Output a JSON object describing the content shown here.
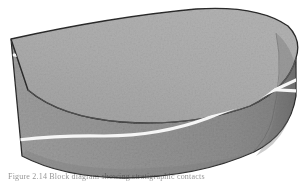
{
  "figure": {
    "shape_name": "half-cylinder block",
    "caption": "Figure 2.14 Block diagram showing stratigraphic contacts",
    "background_color": "#ffffff",
    "outline_color": "#2b2b2b",
    "top_surface_color": "#a9a9a9",
    "front_face_color": "#949494",
    "cap_shadow_color": "#7d7d7d",
    "stratum_line_color": "#f7f7f7"
  },
  "surfaces": [
    {
      "name": "top-surface",
      "label": "Top surface",
      "fill": "#a9a9a9"
    },
    {
      "name": "front-face",
      "label": "Front face",
      "fill": "#949494"
    },
    {
      "name": "right-cap",
      "label": "Right cylindrical cap",
      "fill": "#8a8a8a"
    }
  ],
  "strata": [
    {
      "name": "upper-contact",
      "label": "Upper stratigraphic contact",
      "color": "#f7f7f7",
      "width": 3.2,
      "start_point": [
        24,
        60
      ],
      "end_point": [
        292,
        92
      ]
    },
    {
      "name": "lower-contact",
      "label": "Lower stratigraphic contact",
      "color": "#f7f7f7",
      "width": 3.2,
      "start_point": [
        26,
        139
      ],
      "end_point": [
        292,
        84
      ]
    }
  ],
  "geometry": {
    "top_left_vertex": [
      11,
      39
    ],
    "top_apex": [
      225,
      8
    ],
    "bottom_left_vertex": [
      22,
      156
    ],
    "right_extent": [
      296,
      88
    ]
  }
}
